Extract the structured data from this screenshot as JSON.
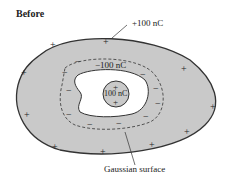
{
  "title": "Before",
  "labels": {
    "outer_charge": "+100 nC",
    "inner_surface_charge": "−100 nC",
    "center_charge": "100 nC",
    "gaussian_surface": "Gaussian surface"
  },
  "symbols": {
    "plus": "+",
    "minus": "−"
  },
  "colors": {
    "conductor_fill": "#c9c9c9",
    "outline": "#333333",
    "cavity": "#ffffff"
  }
}
